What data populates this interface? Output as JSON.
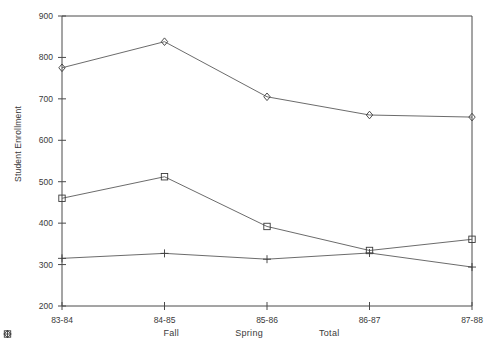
{
  "chart_data": {
    "type": "line",
    "title": "",
    "xlabel": "",
    "ylabel": "Student Enrollment",
    "categories": [
      "83-84",
      "84-85",
      "85-86",
      "86-87",
      "87-88"
    ],
    "ylim": [
      200,
      900
    ],
    "yticks": [
      200,
      300,
      400,
      500,
      600,
      700,
      800,
      900
    ],
    "grid": false,
    "legend_position": "bottom",
    "series": [
      {
        "name": "Fall",
        "marker": "square",
        "values": [
          460,
          512,
          392,
          334,
          361
        ]
      },
      {
        "name": "Spring",
        "marker": "plus",
        "values": [
          315,
          327,
          313,
          328,
          294
        ]
      },
      {
        "name": "Total",
        "marker": "diamond",
        "values": [
          775,
          838,
          705,
          661,
          656
        ]
      }
    ]
  },
  "axis": {
    "y_labels": [
      "900",
      "800",
      "700",
      "600",
      "500",
      "400",
      "300",
      "200"
    ],
    "x_labels": [
      "83-84",
      "84-85",
      "85-86",
      "86-87",
      "87-88"
    ],
    "y_title": "Student Enrollment"
  },
  "legend": {
    "items": [
      {
        "label": "Fall",
        "marker": "square-marker-icon"
      },
      {
        "label": "Spring",
        "marker": "plus-marker-icon"
      },
      {
        "label": "Total",
        "marker": "diamond-marker-icon"
      }
    ]
  }
}
